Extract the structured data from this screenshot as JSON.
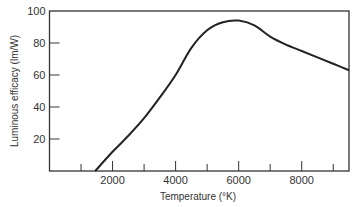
{
  "chart_data": {
    "type": "line",
    "title": "",
    "xlabel": "Temperature (°K)",
    "ylabel": "Luminous efficacy (lm/W)",
    "xlim": [
      0,
      9500
    ],
    "ylim": [
      0,
      100
    ],
    "x_ticks_major": [
      2000,
      4000,
      6000,
      8000
    ],
    "x_ticks_minor": [
      1000,
      3000,
      5000,
      7000,
      9000
    ],
    "y_ticks": [
      20,
      40,
      60,
      80,
      100
    ],
    "grid": false,
    "legend": null,
    "series": [
      {
        "name": "Luminous efficacy",
        "x": [
          1450,
          2000,
          2500,
          3000,
          3500,
          4000,
          4500,
          5000,
          5500,
          6000,
          6500,
          7000,
          7500,
          8000,
          8500,
          9000,
          9500
        ],
        "y": [
          0,
          12,
          22,
          33,
          46,
          60,
          77,
          88,
          93,
          94,
          91,
          84,
          79,
          75,
          71,
          67,
          63
        ]
      }
    ]
  },
  "axes": {
    "x_tick_labels": [
      "2000",
      "4000",
      "6000",
      "8000"
    ],
    "y_tick_labels": [
      "20",
      "40",
      "60",
      "80",
      "100"
    ],
    "xlabel": "Temperature (°K)",
    "ylabel": "Luminous efficacy (lm/W)"
  },
  "colors": {
    "line": "#222222",
    "axis": "#333333",
    "background": "#ffffff"
  }
}
